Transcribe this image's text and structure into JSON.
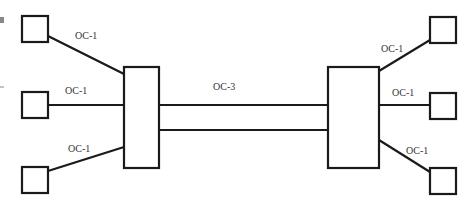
{
  "diagram": {
    "type": "network-topology",
    "stroke_color": "#1a1a1a",
    "label_color": "#333333",
    "nodes": {
      "left_mux": {
        "x": 124,
        "y": 67,
        "w": 35,
        "h": 101
      },
      "right_mux": {
        "x": 328,
        "y": 67,
        "w": 51,
        "h": 101
      },
      "left_terminals": [
        {
          "x": 22,
          "y": 16,
          "w": 26,
          "h": 26
        },
        {
          "x": 22,
          "y": 92,
          "w": 26,
          "h": 26
        },
        {
          "x": 22,
          "y": 167,
          "w": 26,
          "h": 26
        }
      ],
      "right_terminals": [
        {
          "x": 430,
          "y": 17,
          "w": 26,
          "h": 26
        },
        {
          "x": 430,
          "y": 93,
          "w": 26,
          "h": 26
        },
        {
          "x": 430,
          "y": 168,
          "w": 26,
          "h": 26
        }
      ]
    },
    "links": {
      "left": [
        {
          "label": "OC-1",
          "x1": 48,
          "y1": 36,
          "x2": 124,
          "y2": 74,
          "lx": 75,
          "ly": 39
        },
        {
          "label": "OC-1",
          "x1": 48,
          "y1": 105,
          "x2": 124,
          "y2": 105,
          "lx": 65,
          "ly": 94
        },
        {
          "label": "OC-1",
          "x1": 48,
          "y1": 171,
          "x2": 124,
          "y2": 147,
          "lx": 68,
          "ly": 152
        }
      ],
      "trunk": {
        "label": "OC-3",
        "lx": 213,
        "ly": 90,
        "lines": [
          {
            "x1": 159,
            "y1": 105,
            "x2": 328,
            "y2": 105
          },
          {
            "x1": 159,
            "y1": 130,
            "x2": 328,
            "y2": 130
          }
        ]
      },
      "right": [
        {
          "label": "OC-1",
          "x1": 379,
          "y1": 71,
          "x2": 430,
          "y2": 40,
          "lx": 381,
          "ly": 52
        },
        {
          "label": "OC-1",
          "x1": 379,
          "y1": 105,
          "x2": 430,
          "y2": 105,
          "lx": 392,
          "ly": 96
        },
        {
          "label": "OC-1",
          "x1": 379,
          "y1": 140,
          "x2": 430,
          "y2": 172,
          "lx": 406,
          "ly": 154
        }
      ]
    },
    "artifacts": {
      "edge_mark_square": {
        "x": 0,
        "y": 17,
        "w": 4,
        "h": 6,
        "color": "#888888"
      },
      "edge_mark_dash": {
        "x1": 0,
        "y1": 87,
        "x2": 4,
        "y2": 87,
        "color": "#888888"
      }
    }
  }
}
